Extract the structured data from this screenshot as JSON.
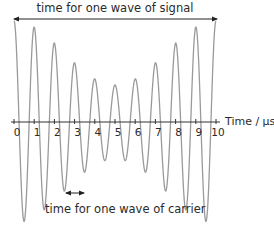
{
  "diagram": {
    "top_label": "time for one wave of signal",
    "bottom_label": "time for one wave of carrier",
    "axis_label": "Time / µs",
    "tick_labels": [
      "0",
      "1",
      "2",
      "3",
      "4",
      "5",
      "6",
      "7",
      "8",
      "9",
      "10"
    ],
    "colors": {
      "wave": "#9a9a9a",
      "axis": "#333333",
      "arrow": "#222222",
      "text": "#2a2a2a"
    }
  },
  "chart_data": {
    "type": "line",
    "xlabel": "Time / µs",
    "ylabel": "",
    "xlim": [
      0,
      10
    ],
    "x_ticks": [
      0,
      1,
      2,
      3,
      4,
      5,
      6,
      7,
      8,
      9,
      10
    ],
    "carrier_period_us": 1,
    "signal_period_us": 10,
    "envelope": {
      "description": "amplitude largest at t=0 and t=10, smallest at t=5",
      "peak_amplitudes_relative": {
        "t0": 1.0,
        "t1": 0.92,
        "t2": 0.76,
        "t3": 0.57,
        "t4": 0.43,
        "t5": 0.37,
        "t6": 0.43,
        "t7": 0.57,
        "t8": 0.76,
        "t9": 0.92,
        "t10": 1.0
      }
    },
    "annotations": [
      {
        "text": "time for one wave of signal",
        "type": "double-arrow",
        "from": 0,
        "to": 10,
        "position": "top"
      },
      {
        "text": "time for one wave of carrier",
        "type": "double-arrow",
        "from": 2.5,
        "to": 3.5,
        "position": "bottom"
      }
    ]
  }
}
